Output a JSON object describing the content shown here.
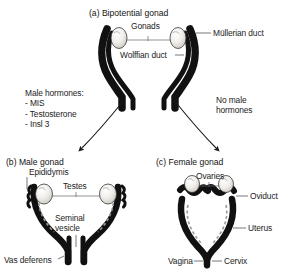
{
  "figure": {
    "caption_type": "scientific-diagram",
    "colors": {
      "duct_black": "#111111",
      "gonad_outline": "#3a3a3a",
      "gonad_fill": "#f2f0ed",
      "leader_line": "#555555",
      "arrow": "#1a1a1a",
      "text": "#1c1c1c",
      "background": "#ffffff"
    }
  },
  "panel_a": {
    "title": "(a)  Bipotential gonad",
    "labels": {
      "gonads": "Gonads",
      "mullerian_duct": "Müllerian duct",
      "wolffian_duct": "Wolffian duct"
    }
  },
  "transition": {
    "male_hormones_heading": "Male hormones:",
    "male_hormones_list": [
      "- MIS",
      "- Testosterone",
      "- Insl 3"
    ],
    "male_hormones_block": "Male hormones:\n- MIS\n- Testosterone\n- Insl 3",
    "no_male_hormones": "No male\nhormones",
    "arrow_left_name": "arrow-to-male",
    "arrow_right_name": "arrow-to-female"
  },
  "panel_b": {
    "title": "(b)  Male gonad",
    "labels": {
      "epididymis": "Epididymis",
      "testes": "Testes",
      "seminal_vesicle": "Seminal\nvesicle",
      "vas_deferens": "Vas deferens"
    }
  },
  "panel_c": {
    "title": "(c)  Female gonad",
    "labels": {
      "ovaries": "Ovaries",
      "oviduct": "Oviduct",
      "uterus": "Uterus",
      "cervix": "Cervix",
      "vagina": "Vagina"
    }
  }
}
